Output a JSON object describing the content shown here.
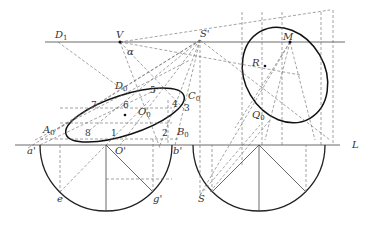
{
  "diagram": {
    "type": "descriptive-geometry perspective construction",
    "colors": {
      "line": "#333333",
      "dashed": "#555555",
      "background": "#ffffff"
    },
    "labels": {
      "D1": "D",
      "D1_sub": "1",
      "V": "V",
      "alpha": "α",
      "S_prime": "S'",
      "M": "M",
      "R": "R",
      "Q0": "Q",
      "Q0_sub": "0",
      "D0": "D",
      "D0_sub": "0",
      "C0": "C",
      "C0_sub": "0",
      "O0": "O",
      "O0_sub": "0",
      "A0": "A",
      "A0_sub": "0",
      "B0": "B",
      "B0_sub": "0",
      "a_prime": "a'",
      "b_prime": "b'",
      "O_prime": "O'",
      "e": "e",
      "g_prime": "g'",
      "S": "S",
      "L": "L",
      "n1": "1",
      "n2": "2",
      "n3": "3",
      "n4": "4",
      "n5": "5",
      "n6": "6",
      "n7": "7",
      "n8": "8"
    }
  }
}
